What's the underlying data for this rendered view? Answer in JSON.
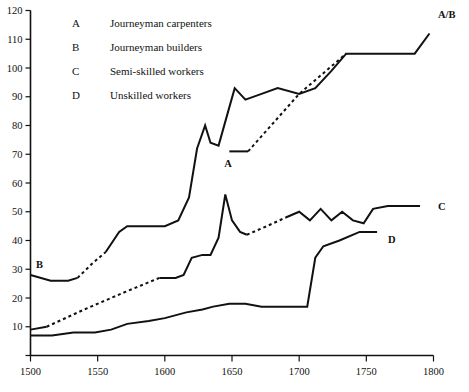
{
  "legend": {
    "position": "top-left-inside",
    "entries": [
      {
        "key": "A",
        "label": "Journeyman carpenters"
      },
      {
        "key": "B",
        "label": "Journeyman builders"
      },
      {
        "key": "C",
        "label": "Semi-skilled workers"
      },
      {
        "key": "D",
        "label": "Unskilled workers"
      }
    ]
  },
  "axis": {
    "y_ticks": [
      "0",
      "10",
      "20",
      "30",
      "40",
      "50",
      "60",
      "70",
      "80",
      "90",
      "100",
      "110",
      "120"
    ],
    "x_ticks": [
      "1500",
      "1550",
      "1600",
      "1650",
      "1700",
      "1750",
      "1800"
    ]
  },
  "series_end_labels": {
    "ab": "A/B",
    "a": "A",
    "b": "B",
    "c": "C",
    "d": "D"
  },
  "colors": {
    "ink": "#111111",
    "background": "#ffffff"
  },
  "chart_data": {
    "type": "line",
    "title": "",
    "subtitle": "",
    "xlabel": "",
    "ylabel": "",
    "xlim": [
      1500,
      1800
    ],
    "ylim": [
      0,
      120
    ],
    "xticks": [
      1500,
      1550,
      1600,
      1650,
      1700,
      1750,
      1800
    ],
    "yticks": [
      0,
      10,
      20,
      30,
      40,
      50,
      60,
      70,
      80,
      90,
      100,
      110,
      120
    ],
    "grid": false,
    "legend_position": "upper left",
    "note": "Dashed segments denote interpolated / estimated data; solid segments denote observed data. Series A merges with series B after about 1735 (labelled A/B).",
    "series": [
      {
        "name": "A",
        "label": "Journeyman carpenters",
        "style": "solid-with-dashed-gap",
        "segments": [
          {
            "style": "solid",
            "x": [
              1648,
              1662
            ],
            "y": [
              71,
              71
            ]
          },
          {
            "style": "dashed",
            "x": [
              1662,
              1700,
              1735
            ],
            "y": [
              71,
              91,
              105
            ]
          }
        ]
      },
      {
        "name": "B",
        "label": "Journeyman builders",
        "style": "solid-with-dashed-gap",
        "segments": [
          {
            "style": "solid",
            "x": [
              1500,
              1515,
              1528,
              1535
            ],
            "y": [
              28,
              26,
              26,
              27
            ]
          },
          {
            "style": "dashed",
            "x": [
              1535,
              1546,
              1556
            ],
            "y": [
              27,
              32,
              36
            ]
          },
          {
            "style": "solid",
            "x": [
              1556,
              1566,
              1572,
              1600,
              1610,
              1618,
              1624,
              1630,
              1634,
              1640,
              1646,
              1652,
              1660,
              1672,
              1684,
              1700,
              1712,
              1724,
              1735,
              1748,
              1775,
              1786,
              1797
            ],
            "y": [
              36,
              43,
              45,
              45,
              47,
              55,
              72,
              80,
              74,
              73,
              83,
              93,
              89,
              91,
              93,
              91,
              93,
              99,
              105,
              105,
              105,
              105,
              112
            ]
          }
        ]
      },
      {
        "name": "C",
        "label": "Semi-skilled workers",
        "style": "solid-with-dashed-gap",
        "segments": [
          {
            "style": "solid",
            "x": [
              1500,
              1512
            ],
            "y": [
              9,
              10
            ]
          },
          {
            "style": "dashed",
            "x": [
              1512,
              1540,
              1570,
              1596
            ],
            "y": [
              10,
              16,
              22,
              27
            ]
          },
          {
            "style": "solid",
            "x": [
              1596,
              1608,
              1614,
              1620,
              1628,
              1634,
              1640,
              1645,
              1650,
              1656,
              1661
            ],
            "y": [
              27,
              27,
              28,
              34,
              35,
              35,
              41,
              56,
              47,
              43,
              42
            ]
          },
          {
            "style": "dashed",
            "x": [
              1661,
              1676,
              1690
            ],
            "y": [
              42,
              45,
              48
            ]
          },
          {
            "style": "solid",
            "x": [
              1690,
              1700,
              1708,
              1716,
              1724,
              1732,
              1740,
              1748,
              1755,
              1766,
              1790
            ],
            "y": [
              48,
              50,
              47,
              51,
              47,
              50,
              47,
              46,
              51,
              52,
              52
            ]
          }
        ]
      },
      {
        "name": "D",
        "label": "Unskilled workers",
        "style": "solid",
        "segments": [
          {
            "style": "solid",
            "x": [
              1500,
              1516,
              1532,
              1548,
              1560,
              1572,
              1588,
              1600,
              1616,
              1628,
              1636,
              1648,
              1660,
              1672,
              1688,
              1702,
              1706,
              1712,
              1718,
              1730,
              1745,
              1758
            ],
            "y": [
              7,
              7,
              8,
              8,
              9,
              11,
              12,
              13,
              15,
              16,
              17,
              18,
              18,
              17,
              17,
              17,
              17,
              34,
              38,
              40,
              43,
              43
            ]
          }
        ]
      }
    ]
  }
}
